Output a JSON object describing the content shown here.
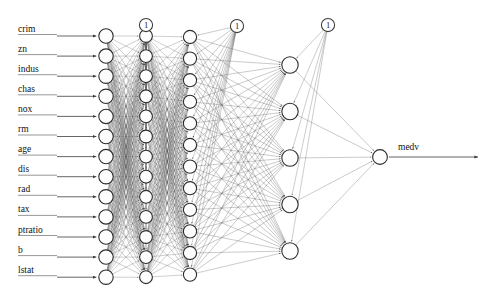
{
  "figure": {
    "kind": "neural-network-diagram",
    "width": 490,
    "height": 305,
    "background_color": "#ffffff",
    "node_fill_color": "#fdfdfd",
    "node_stroke_color": "#2b2b2b",
    "edge_color": "#555555",
    "label_color": "#111111"
  },
  "inputs": {
    "label_x": 18,
    "node_x": 106,
    "first_y": 36,
    "spacing": 20.1,
    "radius": 7.2,
    "arrow_start_x": 57,
    "items": [
      {
        "label": "crim"
      },
      {
        "label": "zn"
      },
      {
        "label": "indus"
      },
      {
        "label": "chas"
      },
      {
        "label": "nox"
      },
      {
        "label": "rm"
      },
      {
        "label": "age"
      },
      {
        "label": "dis"
      },
      {
        "label": "rad"
      },
      {
        "label": "tax"
      },
      {
        "label": "ptratio"
      },
      {
        "label": "b"
      },
      {
        "label": "lstat"
      }
    ]
  },
  "hidden_layers": [
    {
      "name": "hidden-layer-1",
      "node_x": 146,
      "node_count": 13,
      "first_y": 36,
      "spacing": 20.1,
      "radius": 6.4
    },
    {
      "name": "hidden-layer-2",
      "node_x": 190,
      "node_count": 12,
      "first_y": 37,
      "spacing": 21.6,
      "radius": 6.6
    },
    {
      "name": "hidden-layer-3",
      "node_x": 290,
      "node_count": 5,
      "first_y": 65,
      "spacing": 46.5,
      "radius": 8.2
    }
  ],
  "output": {
    "node_x": 380,
    "node_y": 157,
    "radius": 7.4,
    "label": "medv",
    "label_x": 398,
    "label_y": 150,
    "arrow_end_x": 478
  },
  "bias_nodes": [
    {
      "label": "1",
      "x": 146,
      "y": 25,
      "radius": 6.6,
      "target_layer": 1
    },
    {
      "label": "1",
      "x": 237,
      "y": 26,
      "radius": 6.6,
      "target_layer": 2
    },
    {
      "label": "1",
      "x": 328,
      "y": 25,
      "radius": 6.6,
      "target_layer": 3
    }
  ],
  "chart_data": {
    "type": "diagram",
    "title": "",
    "architecture": [
      13,
      13,
      12,
      5,
      1
    ],
    "input_labels": [
      "crim",
      "zn",
      "indus",
      "chas",
      "nox",
      "rm",
      "age",
      "dis",
      "rad",
      "tax",
      "ptratio",
      "b",
      "lstat"
    ],
    "output_labels": [
      "medv"
    ],
    "bias_labels": [
      "1",
      "1",
      "1"
    ],
    "fully_connected": true
  }
}
